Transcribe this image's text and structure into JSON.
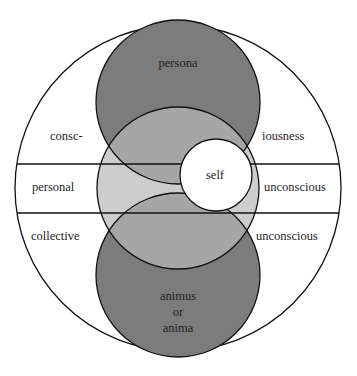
{
  "diagram": {
    "colors": {
      "background": "#ffffff",
      "stroke": "#111111",
      "dark": "#7c7c7c",
      "medium": "#a6a6a6",
      "light": "#cdcdcd",
      "self": "#ffffff"
    },
    "labels": {
      "persona": "persona",
      "consc_left": "consc-",
      "consc_right": "iousness",
      "personal": "personal",
      "personal_unconscious": "unconscious",
      "collective": "collective",
      "collective_unconscious": "unconscious",
      "self": "self",
      "animus": "animus",
      "or": "or",
      "anima": "anima"
    }
  }
}
